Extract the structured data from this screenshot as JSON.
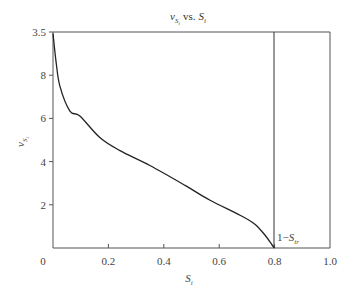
{
  "chart_data": {
    "type": "line",
    "title_parts": {
      "v": "v",
      "v_sub": "S",
      "v_subsub": "i",
      "vs": "vs.",
      "s": "S",
      "s_sub": "i"
    },
    "xlabel": "S_i",
    "xlabel_parts": {
      "main": "S",
      "sub": "i"
    },
    "ylabel": "v_{S_i}",
    "ylabel_parts": {
      "main": "v",
      "sub": "S",
      "subsub": "i"
    },
    "xlim": [
      0,
      1.0
    ],
    "ylim": [
      0,
      10
    ],
    "x_ticks": [
      {
        "value": 0,
        "label": "0"
      },
      {
        "value": 0.2,
        "label": "0.2"
      },
      {
        "value": 0.4,
        "label": "0.4"
      },
      {
        "value": 0.6,
        "label": "0.6"
      },
      {
        "value": 0.8,
        "label": "0.8"
      },
      {
        "value": 1.0,
        "label": "1.0"
      }
    ],
    "y_ticks": [
      {
        "value": 2,
        "label": "2"
      },
      {
        "value": 4,
        "label": "4"
      },
      {
        "value": 6,
        "label": "6"
      },
      {
        "value": 8,
        "label": "8"
      },
      {
        "value": 10,
        "label": "3.5"
      }
    ],
    "grid": false,
    "legend": null,
    "series": [
      {
        "name": "v_{S_i}",
        "color": "#222222",
        "x": [
          0.0,
          0.011,
          0.025,
          0.061,
          0.097,
          0.17,
          0.242,
          0.35,
          0.477,
          0.567,
          0.675,
          0.729,
          0.765,
          0.791,
          0.8
        ],
        "y": [
          9.93,
          8.64,
          7.49,
          6.34,
          6.11,
          5.1,
          4.51,
          3.82,
          2.9,
          2.21,
          1.52,
          1.1,
          0.6,
          0.14,
          0.0
        ]
      }
    ],
    "vertical_lines": [
      {
        "x": 0.8,
        "label": "1-S_{ir}"
      }
    ],
    "annotations": [
      {
        "text": "1−S_{ir}",
        "x": 0.8,
        "y": 0.3,
        "parts": {
          "prefix": "1−",
          "main": "S",
          "sub": "ir"
        }
      }
    ]
  }
}
